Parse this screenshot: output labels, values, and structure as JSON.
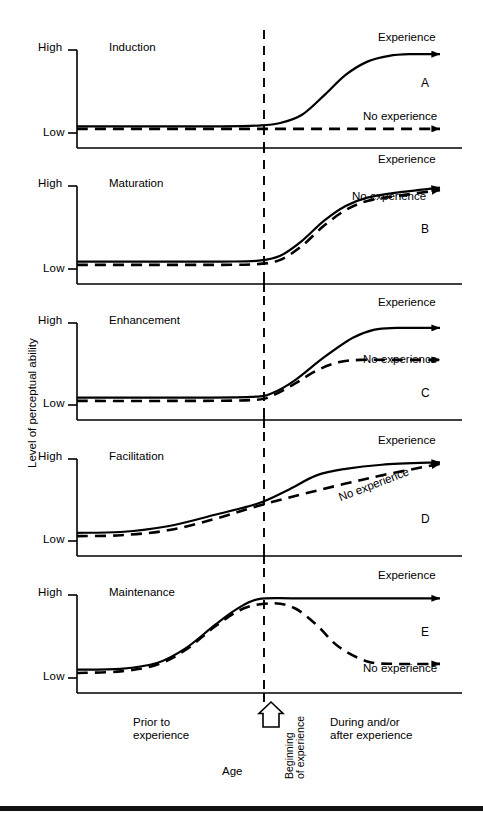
{
  "figure": {
    "y_axis_label": "Level of perceptual ability",
    "x_axis_label": "Age",
    "axis_ticks": {
      "high": "High",
      "low": "Low"
    },
    "x_regions": {
      "left_line1": "Prior to",
      "left_line2": "experience",
      "center_line1": "Beginning",
      "center_line2": "of experience",
      "right_line1": "During and/or",
      "right_line2": "after experience"
    },
    "marker_icon": "up-arrow-icon",
    "series_labels": {
      "experience": "Experience",
      "no_experience": "No experience"
    }
  },
  "chart_data": {
    "type": "line",
    "title": "",
    "xlabel": "Age",
    "ylabel": "Level of perceptual ability",
    "ylim": [
      0,
      1
    ],
    "ytick_labels": [
      "Low",
      "High"
    ],
    "grid": false,
    "legend": "inline-curve-labels",
    "annotation": "Dashed vertical line marks beginning of experience at x = 0.5",
    "panels": [
      {
        "letter": "A",
        "name": "Induction",
        "series": [
          {
            "name": "Experience",
            "style": "solid",
            "x": [
              0.0,
              0.2,
              0.4,
              0.5,
              0.56,
              0.62,
              0.68,
              0.74,
              0.8,
              0.86,
              0.92,
              1.0
            ],
            "y": [
              0.08,
              0.08,
              0.08,
              0.09,
              0.12,
              0.22,
              0.45,
              0.7,
              0.86,
              0.93,
              0.95,
              0.95
            ]
          },
          {
            "name": "No experience",
            "style": "dashed",
            "x": [
              0.0,
              0.25,
              0.5,
              0.75,
              1.0
            ],
            "y": [
              0.05,
              0.05,
              0.05,
              0.05,
              0.05
            ]
          }
        ]
      },
      {
        "letter": "B",
        "name": "Maturation",
        "series": [
          {
            "name": "Experience",
            "style": "solid",
            "x": [
              0.0,
              0.2,
              0.4,
              0.5,
              0.56,
              0.62,
              0.68,
              0.74,
              0.8,
              0.88,
              1.0
            ],
            "y": [
              0.09,
              0.09,
              0.09,
              0.1,
              0.16,
              0.34,
              0.58,
              0.76,
              0.86,
              0.92,
              0.98
            ]
          },
          {
            "name": "No experience",
            "style": "dashed",
            "x": [
              0.0,
              0.2,
              0.4,
              0.5,
              0.56,
              0.62,
              0.68,
              0.74,
              0.8,
              0.88,
              1.0
            ],
            "y": [
              0.05,
              0.05,
              0.05,
              0.06,
              0.11,
              0.28,
              0.52,
              0.71,
              0.82,
              0.88,
              0.95
            ]
          }
        ]
      },
      {
        "letter": "C",
        "name": "Enhancement",
        "series": [
          {
            "name": "Experience",
            "style": "solid",
            "x": [
              0.0,
              0.25,
              0.48,
              0.54,
              0.6,
              0.68,
              0.76,
              0.82,
              0.88,
              1.0
            ],
            "y": [
              0.09,
              0.09,
              0.1,
              0.15,
              0.3,
              0.58,
              0.82,
              0.92,
              0.94,
              0.94
            ]
          },
          {
            "name": "No experience",
            "style": "dashed",
            "x": [
              0.0,
              0.25,
              0.48,
              0.54,
              0.6,
              0.66,
              0.72,
              0.78,
              0.88,
              1.0
            ],
            "y": [
              0.05,
              0.05,
              0.06,
              0.12,
              0.26,
              0.42,
              0.52,
              0.55,
              0.55,
              0.55
            ]
          }
        ]
      },
      {
        "letter": "D",
        "name": "Facilitation",
        "series": [
          {
            "name": "Experience",
            "style": "solid",
            "x": [
              0.0,
              0.12,
              0.25,
              0.38,
              0.5,
              0.58,
              0.66,
              0.74,
              0.84,
              1.0
            ],
            "y": [
              0.1,
              0.11,
              0.18,
              0.32,
              0.46,
              0.62,
              0.8,
              0.88,
              0.93,
              0.96
            ]
          },
          {
            "name": "No experience",
            "style": "dashed",
            "x": [
              0.0,
              0.12,
              0.25,
              0.38,
              0.5,
              0.62,
              0.74,
              0.86,
              1.0
            ],
            "y": [
              0.06,
              0.07,
              0.13,
              0.27,
              0.43,
              0.57,
              0.7,
              0.82,
              0.94
            ]
          }
        ]
      },
      {
        "letter": "E",
        "name": "Maintenance",
        "series": [
          {
            "name": "Experience",
            "style": "solid",
            "x": [
              0.0,
              0.12,
              0.22,
              0.3,
              0.38,
              0.44,
              0.5,
              0.6,
              0.8,
              1.0
            ],
            "y": [
              0.1,
              0.11,
              0.18,
              0.36,
              0.64,
              0.83,
              0.95,
              0.96,
              0.96,
              0.96
            ]
          },
          {
            "name": "No experience",
            "style": "dashed",
            "x": [
              0.0,
              0.12,
              0.22,
              0.3,
              0.38,
              0.46,
              0.54,
              0.6,
              0.66,
              0.72,
              0.8,
              0.88,
              1.0
            ],
            "y": [
              0.06,
              0.08,
              0.16,
              0.34,
              0.62,
              0.84,
              0.9,
              0.84,
              0.64,
              0.38,
              0.2,
              0.17,
              0.17
            ]
          }
        ]
      }
    ]
  }
}
